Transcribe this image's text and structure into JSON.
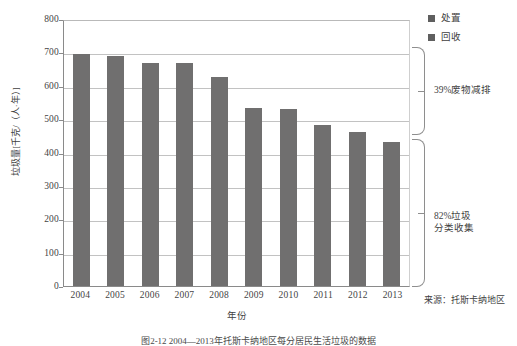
{
  "chart_data": {
    "type": "bar",
    "title": "",
    "categories": [
      "2004",
      "2005",
      "2006",
      "2007",
      "2008",
      "2009",
      "2010",
      "2011",
      "2012",
      "2013"
    ],
    "values": [
      694,
      688,
      668,
      668,
      627,
      532,
      531,
      481,
      462,
      432
    ],
    "series": [
      {
        "name": "处置",
        "values": [
          694,
          688,
          668,
          668,
          627,
          532,
          531,
          481,
          462,
          432
        ]
      }
    ],
    "xlabel": "年份",
    "ylabel": "垃圾量[千克/（人·年）]",
    "ylim": [
      0,
      800
    ],
    "yticks": [
      0,
      100,
      200,
      300,
      400,
      500,
      600,
      700,
      800
    ],
    "ytick_labels": [
      "0",
      "100",
      "200",
      "300",
      "400",
      "500",
      "600",
      "700",
      "800"
    ],
    "grid": true,
    "legend_position": "top-right",
    "bar_color": "#706f6f",
    "annotations": [
      {
        "text": "39%废物减排",
        "range": [
          430,
          700
        ]
      },
      {
        "text": "82%垃圾\n分类收集",
        "range": [
          0,
          430
        ]
      }
    ]
  },
  "legend": {
    "items": [
      {
        "label": "处置",
        "color": "#5f5f5f"
      },
      {
        "label": "回收",
        "color": "#5f5f5f"
      }
    ]
  },
  "annotations": {
    "upper": "39%废物减排",
    "lower_line1": "82%垃圾",
    "lower_line2": "分类收集"
  },
  "source": "来源：托斯卡纳地区",
  "caption": "图2-12  2004—2013年托斯卡纳地区每分居民生活垃圾的数据",
  "axes": {
    "y_title": "垃圾量[千克/（人·年）]",
    "x_title": "年份"
  }
}
